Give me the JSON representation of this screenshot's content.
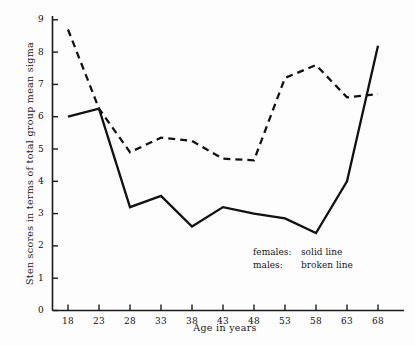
{
  "chart_data": {
    "type": "line",
    "title": "",
    "xlabel": "Age in years",
    "ylabel": "Sten scores in terms of total group mean sigma",
    "x": [
      18,
      23,
      28,
      33,
      38,
      43,
      48,
      53,
      58,
      63,
      68
    ],
    "xtick_labels": [
      "18",
      "23",
      "28",
      "33",
      "38",
      "43",
      "48",
      "53",
      "58",
      "63",
      "68"
    ],
    "ytick_labels": [
      "0",
      "1",
      "2",
      "3",
      "4",
      "5",
      "6",
      "7",
      "8",
      "9"
    ],
    "xlim": [
      15.5,
      70.5
    ],
    "ylim": [
      0,
      9.4
    ],
    "grid": false,
    "legend_position": "inside-lower-right",
    "series": [
      {
        "name": "females",
        "style": "solid line",
        "color": "#111111",
        "values": [
          6.0,
          6.25,
          3.2,
          3.55,
          2.6,
          3.2,
          3.0,
          2.85,
          2.4,
          4.0,
          8.2
        ]
      },
      {
        "name": "males",
        "style": "broken line",
        "color": "#111111",
        "values": [
          8.7,
          6.25,
          4.9,
          5.35,
          5.25,
          4.7,
          4.65,
          7.2,
          7.6,
          6.6,
          6.7
        ]
      }
    ]
  },
  "legend": {
    "rows": [
      {
        "key": "females:",
        "desc": "solid line"
      },
      {
        "key": "males:",
        "desc": "broken line"
      }
    ]
  }
}
